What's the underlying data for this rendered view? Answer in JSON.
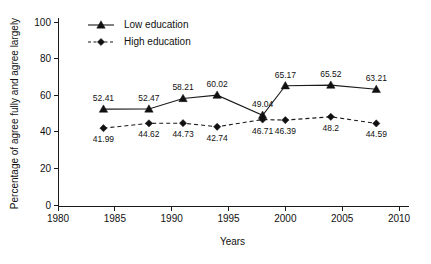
{
  "chart_data": {
    "type": "line",
    "title": "",
    "xlabel": "Years",
    "ylabel": "Percentage of agree fully and agree largely",
    "xlim": [
      1980,
      2010
    ],
    "ylim": [
      0,
      100
    ],
    "xticks": [
      1980,
      1985,
      1990,
      1995,
      2000,
      2005,
      2010
    ],
    "yticks": [
      0,
      20,
      40,
      60,
      80,
      100
    ],
    "grid": false,
    "legend_position": "top-left",
    "x": [
      1984,
      1988,
      1991,
      1994,
      1998,
      2000,
      2004,
      2008
    ],
    "series": [
      {
        "name": "Low education",
        "marker": "triangle",
        "linestyle": "solid",
        "color": "#1a1a1a",
        "values": [
          52.41,
          52.47,
          58.21,
          60.02,
          49.04,
          65.17,
          65.52,
          63.21
        ],
        "labels": [
          "52.41",
          "52.47",
          "58.21",
          "60.02",
          "49.04",
          "65.17",
          "65.52",
          "63.21"
        ],
        "label_positions": [
          "above",
          "above",
          "above",
          "above",
          "above",
          "above",
          "above",
          "above"
        ]
      },
      {
        "name": "High education",
        "marker": "diamond",
        "linestyle": "dashed",
        "color": "#1a1a1a",
        "values": [
          41.99,
          44.62,
          44.73,
          42.74,
          46.71,
          46.39,
          48.2,
          44.59
        ],
        "labels": [
          "41.99",
          "44.62",
          "44.73",
          "42.74",
          "46.71",
          "46.39",
          "48.2",
          "44.59"
        ],
        "label_positions": [
          "below",
          "below",
          "below",
          "below",
          "below",
          "below",
          "below",
          "below"
        ]
      }
    ]
  },
  "axes": {
    "x_tick_labels": [
      "1980",
      "1985",
      "1990",
      "1995",
      "2000",
      "2005",
      "2010"
    ],
    "y_tick_labels": [
      "0",
      "20",
      "40",
      "60",
      "80",
      "100"
    ],
    "x_axis_title": "Years",
    "y_axis_title": "Percentage of agree fully and agree largely"
  },
  "legend": {
    "items": [
      {
        "label": "Low education",
        "marker": "triangle-icon",
        "style": "solid"
      },
      {
        "label": "High education",
        "marker": "diamond-icon",
        "style": "dashed"
      }
    ]
  },
  "colors": {
    "ink": "#1a1a1a",
    "background": "#ffffff"
  }
}
